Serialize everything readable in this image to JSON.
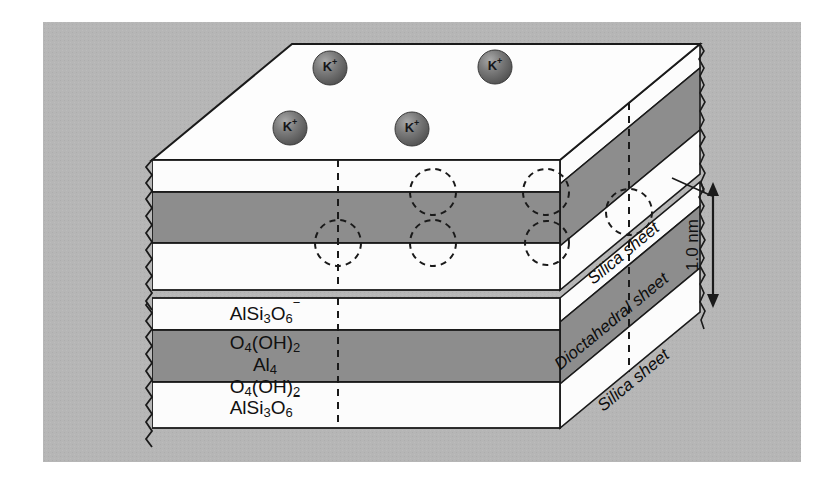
{
  "figure": {
    "background_color": "#ffffff",
    "panel_color": "#b4b4b4",
    "layer_light_color": "#fcfcfc",
    "layer_dark_color": "#8d8d8d",
    "outline_color": "#1a1a1a"
  },
  "interlayer_ions": {
    "label": "K",
    "charge": "+",
    "count": 4,
    "color": "#6b6b6b",
    "positions": [
      {
        "cx": 290,
        "cy": 128
      },
      {
        "cx": 330,
        "cy": 68
      },
      {
        "cx": 412,
        "cy": 129
      },
      {
        "cx": 495,
        "cy": 67
      }
    ]
  },
  "front_face_layers": [
    {
      "name": "silica-sheet-upper-top",
      "fill": "light",
      "formula": null
    },
    {
      "name": "dioctahedral-sheet-upper",
      "fill": "dark",
      "formula": null
    },
    {
      "name": "silica-sheet-upper-bottom",
      "fill": "light",
      "formula": null
    },
    {
      "name": "silica-sheet-lower-top",
      "fill": "light",
      "formula": "AlSi3O6-"
    },
    {
      "name": "dioctahedral-sheet-lower",
      "fill": "dark",
      "formula": "O4(OH)2 / Al4 / O4(OH)2"
    },
    {
      "name": "silica-sheet-lower-bottom",
      "fill": "light",
      "formula": "AlSi3O6-"
    }
  ],
  "formulas": {
    "silica_top": {
      "parts": [
        {
          "t": "AlSi",
          "k": "base"
        },
        {
          "t": "3",
          "k": "sub"
        },
        {
          "t": "O",
          "k": "base"
        },
        {
          "t": "6",
          "k": "subsup"
        }
      ],
      "plain": "AlSi3O6−"
    },
    "octa_line1": {
      "parts": [
        {
          "t": "O",
          "k": "base"
        },
        {
          "t": "4",
          "k": "sub"
        },
        {
          "t": "(OH)",
          "k": "base"
        },
        {
          "t": "2",
          "k": "sub"
        }
      ],
      "plain": "O4(OH)2"
    },
    "octa_line2": {
      "parts": [
        {
          "t": "Al",
          "k": "base"
        },
        {
          "t": "4",
          "k": "sub"
        }
      ],
      "plain": "Al4"
    },
    "octa_line3": {
      "parts": [
        {
          "t": "O",
          "k": "base"
        },
        {
          "t": "4",
          "k": "sub"
        },
        {
          "t": "(OH)",
          "k": "base"
        },
        {
          "t": "2",
          "k": "sub"
        }
      ],
      "plain": "O4(OH)2"
    },
    "silica_bottom": {
      "parts": [
        {
          "t": "AlSi",
          "k": "base"
        },
        {
          "t": "3",
          "k": "sub"
        },
        {
          "t": "O",
          "k": "base"
        },
        {
          "t": "6",
          "k": "subsup"
        }
      ],
      "plain": "AlSi3O6−"
    }
  },
  "side_labels": [
    {
      "id": "silica-sheet-top",
      "text": "Silica sheet"
    },
    {
      "id": "dioctahedral-sheet",
      "text": "Dioctahedral sheet"
    },
    {
      "id": "silica-sheet-bottom",
      "text": "Silica sheet"
    }
  ],
  "dimension": {
    "value": "1.0 nm",
    "orientation": "vertical",
    "arrow_style": "double-headed"
  },
  "cavity_markers": {
    "name": "ditrigonal-cavity",
    "style": "dashed-circle",
    "count": 6
  }
}
